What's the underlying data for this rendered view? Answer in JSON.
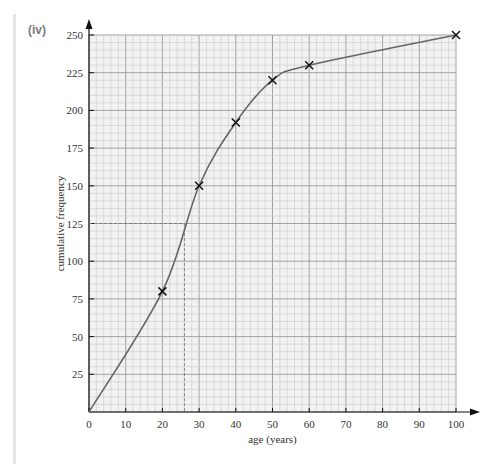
{
  "panel_label": "(iv)",
  "colors": {
    "grid_minor": "#c9c9c9",
    "grid_major": "#9a9a9a",
    "plot_bg": "#f2f2f2",
    "curve": "#666666",
    "marker": "#111111",
    "axis": "#111111"
  },
  "chart_data": {
    "type": "line",
    "title": "",
    "xlabel": "age (years)",
    "ylabel": "cumulative frequency",
    "xlim": [
      0,
      100
    ],
    "ylim": [
      0,
      250
    ],
    "x_ticks": [
      0,
      10,
      20,
      30,
      40,
      50,
      60,
      70,
      80,
      90,
      100
    ],
    "y_ticks": [
      25,
      50,
      75,
      100,
      125,
      150,
      175,
      200,
      225,
      250
    ],
    "grid": true,
    "series": [
      {
        "name": "cumulative frequency curve",
        "x": [
          0,
          20,
          30,
          40,
          50,
          60,
          100
        ],
        "y": [
          0,
          80,
          150,
          192,
          220,
          230,
          250
        ],
        "markers": "x"
      }
    ],
    "annotations": [
      {
        "type": "dashed-line",
        "description": "median reading",
        "from": [
          0,
          125
        ],
        "corner": [
          26,
          125
        ],
        "to": [
          26,
          0
        ]
      }
    ]
  }
}
